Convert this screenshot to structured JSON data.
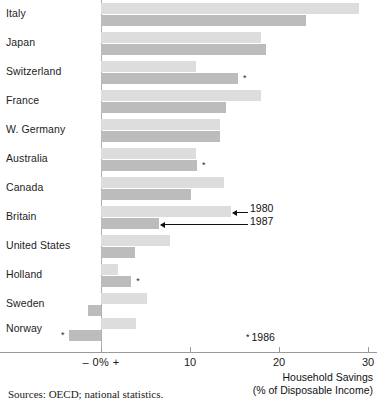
{
  "chart_data": {
    "type": "bar",
    "orientation": "horizontal",
    "title": "",
    "xlabel": "Household Savings (% of Disposable Income)",
    "ylabel": "",
    "xlim": [
      -5,
      30
    ],
    "xticks": [
      0,
      10,
      20,
      30
    ],
    "xtick_labels": [
      "– 0% +",
      "10",
      "20",
      "30"
    ],
    "grid": false,
    "legend_position": "annotated-inline",
    "categories": [
      "Italy",
      "Japan",
      "Switzerland",
      "France",
      "W. Germany",
      "Australia",
      "Canada",
      "Britain",
      "United States",
      "Holland",
      "Sweden",
      "Norway"
    ],
    "series": [
      {
        "name": "1980",
        "color": "#dddddd",
        "values": [
          29.0,
          18.0,
          10.7,
          18.0,
          13.4,
          10.7,
          13.8,
          14.6,
          7.7,
          1.9,
          5.2,
          3.9
        ]
      },
      {
        "name": "1987",
        "color": "#bcbcbc",
        "values": [
          23.0,
          18.5,
          15.4,
          14.0,
          13.4,
          10.8,
          10.1,
          6.5,
          3.8,
          3.4,
          -1.5,
          -3.6
        ]
      }
    ],
    "footnote_marker": "*",
    "footnote_label": "1986",
    "footnote_text": "* 1986",
    "marked_points": [
      {
        "category": "Switzerland",
        "series": "1987"
      },
      {
        "category": "Australia",
        "series": "1987"
      },
      {
        "category": "Holland",
        "series": "1987"
      },
      {
        "category": "Norway",
        "series": "1987"
      }
    ],
    "annotations": [
      {
        "label": "1980",
        "target": "Britain 1980 bar"
      },
      {
        "label": "1987",
        "target": "Britain 1987 bar"
      }
    ],
    "source": "Sources: OECD; national statistics."
  },
  "axis_title": {
    "line1": "Household Savings",
    "line2": "(% of Disposable Income)"
  },
  "colors": {
    "bar_1980": "#dddddd",
    "bar_1987": "#bcbcbc",
    "axis": "#9a9a9a",
    "text": "#1a1a1a"
  }
}
